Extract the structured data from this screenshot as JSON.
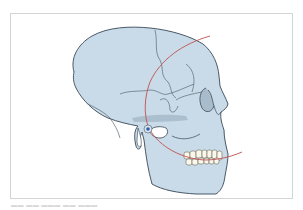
{
  "figure": {
    "colors": {
      "bone": "#c9dbe8",
      "bone_shadow": "#9fb3c4",
      "outline": "#4a5866",
      "suture": "#5a6876",
      "arc": "#c0504d",
      "condyle_point": "#2f5fa8",
      "teeth": "#fbf7ea",
      "frame": "#d4d4d4"
    },
    "annotations": {
      "arc": "red reference arc through condyle and occlusal plane",
      "condyle_marker": "blue point at condyle"
    }
  },
  "caption": {
    "text": "▬▬ ▬▬ ▬▬▬   ▬▬   ▬▬▬"
  }
}
